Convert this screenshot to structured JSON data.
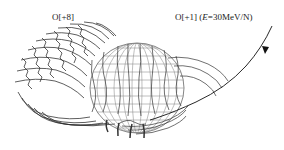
{
  "figure": {
    "type": "particle-trajectory-diagram",
    "labels": {
      "left_ion": "O[+8]",
      "right_ion_prefix": "O[+1] (",
      "right_ion_energy_symbol": "E",
      "right_ion_energy_value": "=30MeV/N)"
    },
    "elements": {
      "sphere": "planet-wireframe-globe",
      "incoming_track": "O[+1] trajectory with arrow",
      "gyrating_band": "O[+8] wavy trajectories"
    },
    "colors": {
      "ink": "#222222",
      "globe_grid": "#888888",
      "background": "#ffffff"
    }
  }
}
